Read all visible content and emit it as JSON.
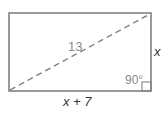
{
  "diagram": {
    "shape": "rectangle",
    "diagonal_label": "13",
    "side_right_label": "x",
    "side_bottom_label": "x + 7",
    "angle_label": "90°",
    "colors": {
      "stroke": "#7a7a7a",
      "text": "#333333",
      "muted_text": "#8a8a8a"
    }
  }
}
